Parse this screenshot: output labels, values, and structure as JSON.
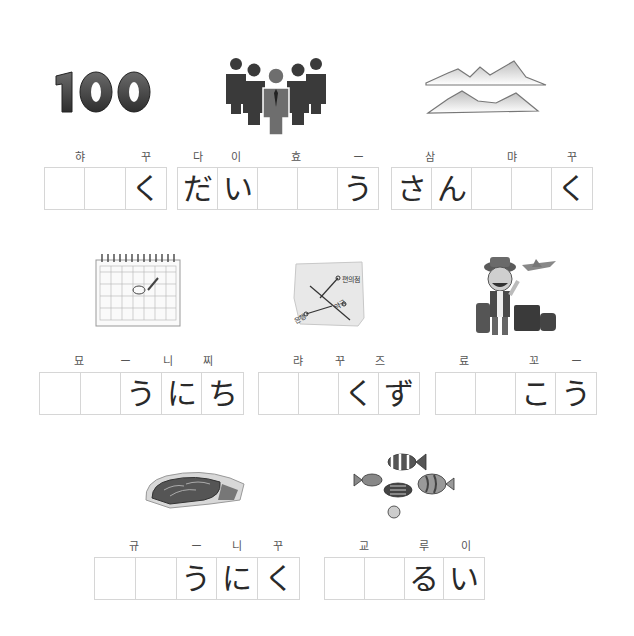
{
  "worksheet": {
    "items": [
      {
        "picture": "number-100",
        "picture_text": "100",
        "labels": [
          {
            "text": "햐",
            "x": 80
          },
          {
            "text": "꾸",
            "x": 146
          }
        ],
        "cells": [
          "",
          "",
          "く"
        ]
      },
      {
        "picture": "group-of-people",
        "labels": [
          {
            "text": "다",
            "x": 198
          },
          {
            "text": "이",
            "x": 236
          },
          {
            "text": "효",
            "x": 296
          },
          {
            "text": "ー",
            "x": 358
          }
        ],
        "cells": [
          "だ",
          "い",
          "",
          "",
          "う"
        ]
      },
      {
        "picture": "mountains",
        "labels": [
          {
            "text": "삼",
            "x": 430
          },
          {
            "text": "먀",
            "x": 512
          },
          {
            "text": "꾸",
            "x": 572
          }
        ],
        "cells": [
          "さ",
          "ん",
          "",
          "",
          "く"
        ]
      },
      {
        "picture": "calendar",
        "labels": [
          {
            "text": "묘",
            "x": 79
          },
          {
            "text": "ー",
            "x": 125
          },
          {
            "text": "니",
            "x": 168
          },
          {
            "text": "찌",
            "x": 208
          }
        ],
        "cells": [
          "",
          "",
          "う",
          "に",
          "ち"
        ]
      },
      {
        "picture": "street-map",
        "map_labels": [
          "편의점",
          "약국",
          "은행"
        ],
        "labels": [
          {
            "text": "랴",
            "x": 298
          },
          {
            "text": "꾸",
            "x": 340
          },
          {
            "text": "즈",
            "x": 380
          }
        ],
        "cells": [
          "",
          "",
          "く",
          "ず"
        ]
      },
      {
        "picture": "traveler",
        "labels": [
          {
            "text": "료",
            "x": 464
          },
          {
            "text": "꼬",
            "x": 534
          },
          {
            "text": "ー",
            "x": 576
          }
        ],
        "cells": [
          "",
          "",
          "こ",
          "う"
        ]
      },
      {
        "picture": "beef-steak",
        "labels": [
          {
            "text": "규",
            "x": 134
          },
          {
            "text": "ー",
            "x": 196
          },
          {
            "text": "니",
            "x": 237
          },
          {
            "text": "꾸",
            "x": 278
          }
        ],
        "cells": [
          "",
          "",
          "う",
          "に",
          "く"
        ]
      },
      {
        "picture": "tropical-fish",
        "labels": [
          {
            "text": "교",
            "x": 364
          },
          {
            "text": "루",
            "x": 424
          },
          {
            "text": "이",
            "x": 466
          }
        ],
        "cells": [
          "",
          "",
          "る",
          "い"
        ]
      }
    ]
  },
  "colors": {
    "border": "#d6d6d6",
    "text": "#2a2a2a",
    "label": "#555555",
    "icon_dark": "#3a3a3a",
    "icon_mid": "#6e6e6e"
  }
}
